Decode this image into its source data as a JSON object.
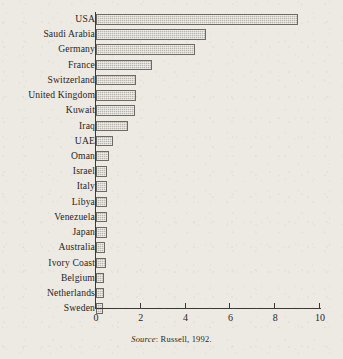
{
  "chart_data": {
    "type": "bar",
    "orientation": "horizontal",
    "title": "",
    "xlabel": "",
    "ylabel": "",
    "xlim": [
      0,
      10
    ],
    "xticks": [
      0,
      2,
      4,
      6,
      8,
      10
    ],
    "xtick_labels": [
      "0",
      "2",
      "4",
      "6",
      "8",
      "10"
    ],
    "grid": false,
    "legend": false,
    "categories": [
      "USA",
      "Saudi Arabia",
      "Germany",
      "France",
      "Switzerland",
      "United Kingdom",
      "Kuwait",
      "Iraq",
      "UAE",
      "Oman",
      "Israel",
      "Italy",
      "Libya",
      "Venezuela",
      "Japan",
      "Australia",
      "Ivory Coast",
      "Belgium",
      "Netherlands",
      "Sweden"
    ],
    "values": [
      9.0,
      4.9,
      4.4,
      2.5,
      1.8,
      1.8,
      1.75,
      1.45,
      0.75,
      0.6,
      0.5,
      0.5,
      0.5,
      0.5,
      0.5,
      0.4,
      0.45,
      0.35,
      0.35,
      0.3
    ]
  },
  "source": {
    "label": "Source",
    "separator": ": ",
    "text": "Russell, 1992."
  },
  "colors": {
    "page_background": "#edeae4",
    "bar_fill": "#b9b6b0",
    "bar_border": "#6d6a64",
    "axis": "#3b3833",
    "text": "#27241f"
  }
}
